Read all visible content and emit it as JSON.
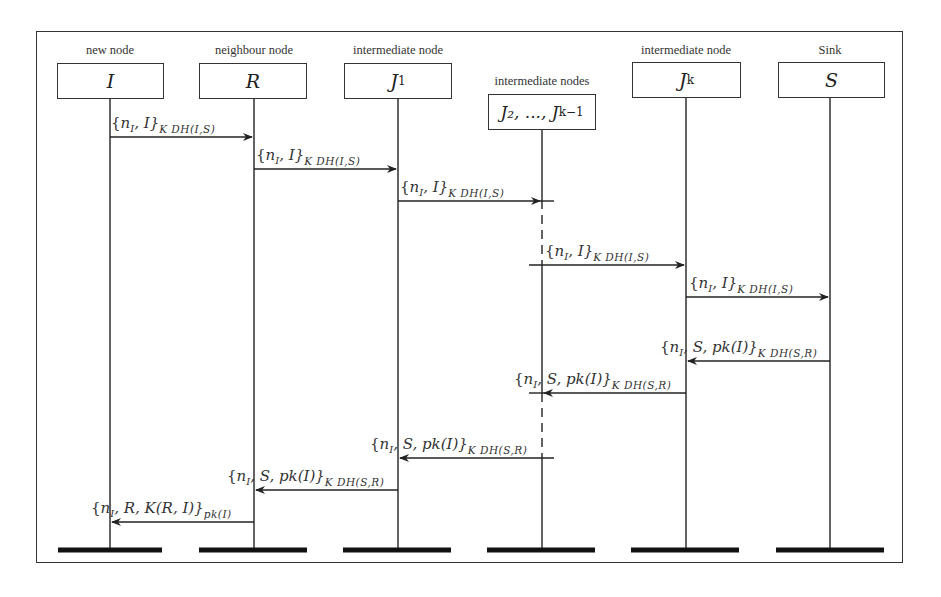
{
  "diagram": {
    "type": "sequence-diagram",
    "participants": [
      {
        "label": "new node",
        "symbol": "I",
        "sub": ""
      },
      {
        "label": "neighbour node",
        "symbol": "R",
        "sub": ""
      },
      {
        "label": "intermediate node",
        "symbol": "J",
        "sub": "1"
      },
      {
        "label": "intermediate nodes",
        "symbol": "J₂, ..., J",
        "sub": "k−1"
      },
      {
        "label": "intermediate node",
        "symbol": "J",
        "sub": "k"
      },
      {
        "label": "Sink",
        "symbol": "S",
        "sub": ""
      }
    ],
    "messages": [
      {
        "from": "I",
        "to": "R",
        "body": "{n_I, I}",
        "key": "K_DH(I,S)"
      },
      {
        "from": "R",
        "to": "J1",
        "body": "{n_I, I}",
        "key": "K_DH(I,S)"
      },
      {
        "from": "J1",
        "to": "J2..Jk-1",
        "body": "{n_I, I}",
        "key": "K_DH(I,S)"
      },
      {
        "from": "J2..Jk-1",
        "to": "Jk",
        "body": "{n_I, I}",
        "key": "K_DH(I,S)"
      },
      {
        "from": "Jk",
        "to": "S",
        "body": "{n_I, I}",
        "key": "K_DH(I,S)"
      },
      {
        "from": "S",
        "to": "Jk",
        "body": "{n_I, S, pk(I)}",
        "key": "K_DH(S,R)"
      },
      {
        "from": "Jk",
        "to": "J2..Jk-1",
        "body": "{n_I, S, pk(I)}",
        "key": "K_DH(S,R)"
      },
      {
        "from": "J2..Jk-1",
        "to": "J1",
        "body": "{n_I, S, pk(I)}",
        "key": "K_DH(S,R)"
      },
      {
        "from": "J1",
        "to": "R",
        "body": "{n_I, S, pk(I)}",
        "key": "K_DH(S,R)"
      },
      {
        "from": "R",
        "to": "I",
        "body": "{n_I, R, K(R, I)}",
        "key": "pk(I)"
      }
    ]
  },
  "text": {
    "m1a": "{",
    "m_nI": "n",
    "m_I_sub": "I",
    "brace_close_I": ", I}",
    "brace_close_S": ", S, pk(I)}",
    "brace_close_R": ", R, K(R, I)}",
    "key_IS": "K DH(I,S)",
    "key_SR": "K DH(S,R)",
    "key_pk": "pk(I)"
  }
}
